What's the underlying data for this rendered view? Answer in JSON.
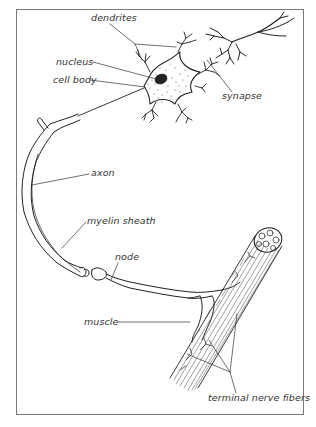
{
  "figure": {
    "type": "labeled anatomical illustration",
    "frame_color": "#7a7a7a",
    "ink_color": "#222222",
    "label_color": "#333333"
  },
  "labels": {
    "dendrites": "dendrites",
    "nucleus": "nucleus",
    "cell_body": "cell body",
    "synapse": "synapse",
    "axon": "axon",
    "myelin_sheath": "myelin sheath",
    "node": "node",
    "muscle": "muscle",
    "terminal_nerve_fibers": "terminal nerve fibers"
  },
  "caption": {
    "text": ""
  }
}
